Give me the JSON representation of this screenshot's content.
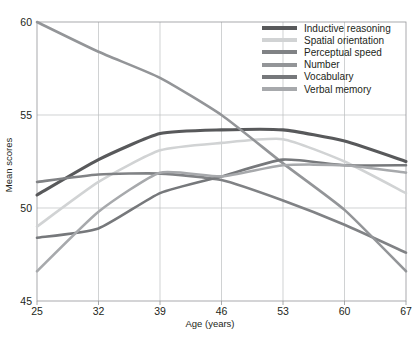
{
  "chart_data": {
    "type": "line",
    "title": "",
    "xlabel": "Age (years)",
    "ylabel": "Mean scores",
    "x": [
      25,
      32,
      39,
      46,
      53,
      60,
      67
    ],
    "xticklabels": [
      "25",
      "32",
      "39",
      "46",
      "53",
      "60",
      "67"
    ],
    "yticklabels": [
      "45",
      "50",
      "55",
      "60"
    ],
    "xlim": [
      25,
      67
    ],
    "ylim": [
      45,
      60
    ],
    "grid": true,
    "legend_position": "top-right",
    "series": [
      {
        "name": "Inductive reasoning",
        "color": "#58595b",
        "values": [
          50.7,
          52.6,
          54.0,
          54.2,
          54.2,
          53.6,
          52.5
        ]
      },
      {
        "name": "Spatial orientation",
        "color": "#d1d3d4",
        "values": [
          49.0,
          51.4,
          53.1,
          53.5,
          53.7,
          52.5,
          50.8
        ]
      },
      {
        "name": "Perceptual speed",
        "color": "#808285",
        "values": [
          51.4,
          51.8,
          51.85,
          51.5,
          50.4,
          49.1,
          47.6
        ]
      },
      {
        "name": "Number",
        "color": "#939598",
        "values": [
          60.0,
          58.4,
          57.0,
          55.0,
          52.4,
          49.9,
          46.6
        ]
      },
      {
        "name": "Vocabulary",
        "color": "#76787b",
        "values": [
          48.4,
          48.9,
          50.8,
          51.7,
          52.6,
          52.3,
          52.3
        ]
      },
      {
        "name": "Verbal memory",
        "color": "#a7a9ac",
        "values": [
          46.6,
          49.8,
          51.9,
          51.7,
          52.3,
          52.3,
          51.9
        ]
      }
    ]
  },
  "axes": {
    "y_label": "Mean scores",
    "x_label": "Age (years)",
    "y_ticks": [
      "60",
      "55",
      "50",
      "45"
    ],
    "x_ticks": [
      "25",
      "32",
      "39",
      "46",
      "53",
      "60",
      "67"
    ]
  },
  "legend": {
    "items": [
      {
        "label": "Inductive reasoning",
        "color": "#58595b"
      },
      {
        "label": "Spatial orientation",
        "color": "#d1d3d4"
      },
      {
        "label": "Perceptual speed",
        "color": "#808285"
      },
      {
        "label": "Number",
        "color": "#939598"
      },
      {
        "label": "Vocabulary",
        "color": "#76787b"
      },
      {
        "label": "Verbal memory",
        "color": "#a7a9ac"
      }
    ]
  },
  "caption": {
    "text": ""
  }
}
